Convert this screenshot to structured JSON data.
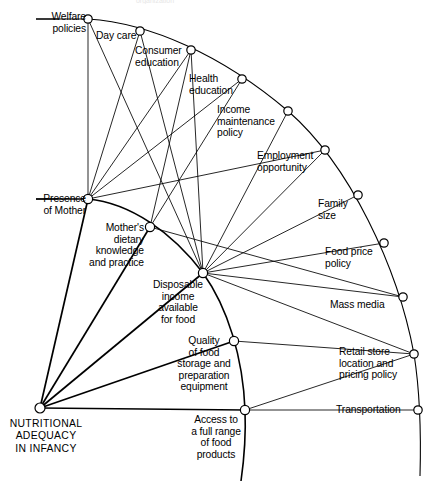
{
  "diagram": {
    "type": "radial-network-diagram",
    "title_partial_cut_off_at_top": "organization",
    "root": {
      "id": "nutritional-adequacy",
      "label": "NUTRITIONAL\nADEQUACY\nIN INFANCY",
      "x": 40,
      "y": 408
    },
    "ring1_label": "inner determinants",
    "nodes": [
      {
        "id": "welfare-policies",
        "label": "Welfare\npolicies",
        "x": 88,
        "y": 19,
        "lx": 28,
        "ly": 11,
        "align": "r",
        "w": 58
      },
      {
        "id": "day-care",
        "label": "Day care",
        "x": 140,
        "y": 31,
        "lx": 96,
        "ly": 30,
        "align": "l",
        "w": 52
      },
      {
        "id": "consumer-education",
        "label": "Consumer\neducation",
        "x": 191,
        "y": 50,
        "lx": 135,
        "ly": 45,
        "align": "l",
        "w": 58
      },
      {
        "id": "health-education",
        "label": "Health\neducation",
        "x": 242,
        "y": 79,
        "lx": 189,
        "ly": 73,
        "align": "l",
        "w": 54
      },
      {
        "id": "income-maintenance",
        "label": "Income\nmaintenance\npolicy",
        "x": 288,
        "y": 111,
        "lx": 218,
        "ly": 104,
        "align": "l",
        "w": 72
      },
      {
        "id": "employment-opportunity",
        "label": "Employment\nopportunity",
        "x": 325,
        "y": 150,
        "lx": 257,
        "ly": 150,
        "align": "l",
        "w": 70
      },
      {
        "id": "family-size",
        "label": "Family\nsize",
        "x": 358,
        "y": 195,
        "lx": 317,
        "ly": 198,
        "align": "l",
        "w": 44
      },
      {
        "id": "food-price-policy",
        "label": "Food price\npolicy",
        "x": 384,
        "y": 243,
        "lx": 325,
        "ly": 246,
        "align": "l",
        "w": 62
      },
      {
        "id": "mass-media",
        "label": "Mass media",
        "x": 403,
        "y": 297,
        "lx": 330,
        "ly": 299,
        "align": "l",
        "w": 70
      },
      {
        "id": "retail-store",
        "label": "Retail store\nlocation and\npricing policy",
        "x": 414,
        "y": 354,
        "lx": 339,
        "ly": 346,
        "align": "l",
        "w": 78
      },
      {
        "id": "transportation",
        "label": "Transportation",
        "x": 418,
        "y": 410,
        "lx": 336,
        "ly": 404,
        "align": "l",
        "w": 82
      },
      {
        "id": "presence-of-mother",
        "label": "Presence\nof Mother",
        "x": 88,
        "y": 199,
        "lx": 30,
        "ly": 193,
        "align": "r",
        "w": 58
      },
      {
        "id": "mothers-dietary-knowledge",
        "label": "Mother's\ndietary\nknowledge\nand practice",
        "x": 150,
        "y": 227,
        "lx": 26,
        "ly": 222,
        "align": "r",
        "w": 118
      },
      {
        "id": "disposable-income",
        "label": "Disposable\nincome\navailable\nfor food",
        "x": 203,
        "y": 273,
        "lx": 143,
        "ly": 279,
        "align": "c",
        "w": 72
      },
      {
        "id": "quality-of-food",
        "label": "Quality\nof food\nstorage and\npreparation\nequipment",
        "x": 234,
        "y": 341,
        "lx": 170,
        "ly": 335,
        "align": "c",
        "w": 70
      },
      {
        "id": "access-to-food",
        "label": "Access to\na full range\nof food\nproducts",
        "x": 245,
        "y": 410,
        "lx": 182,
        "ly": 414,
        "align": "c",
        "w": 68
      }
    ],
    "edges": [
      [
        "welfare-policies",
        "presence-of-mother"
      ],
      [
        "welfare-policies",
        "disposable-income"
      ],
      [
        "day-care",
        "presence-of-mother"
      ],
      [
        "day-care",
        "disposable-income"
      ],
      [
        "consumer-education",
        "presence-of-mother"
      ],
      [
        "consumer-education",
        "mothers-dietary-knowledge"
      ],
      [
        "consumer-education",
        "disposable-income"
      ],
      [
        "health-education",
        "presence-of-mother"
      ],
      [
        "health-education",
        "mothers-dietary-knowledge"
      ],
      [
        "income-maintenance",
        "disposable-income"
      ],
      [
        "employment-opportunity",
        "presence-of-mother"
      ],
      [
        "employment-opportunity",
        "disposable-income"
      ],
      [
        "family-size",
        "disposable-income"
      ],
      [
        "food-price-policy",
        "disposable-income"
      ],
      [
        "mass-media",
        "disposable-income"
      ],
      [
        "mass-media",
        "mothers-dietary-knowledge"
      ],
      [
        "retail-store",
        "disposable-income"
      ],
      [
        "retail-store",
        "access-to-food"
      ],
      [
        "retail-store",
        "quality-of-food"
      ],
      [
        "transportation",
        "access-to-food"
      ],
      [
        "presence-of-mother",
        "nutritional-adequacy"
      ],
      [
        "mothers-dietary-knowledge",
        "nutritional-adequacy"
      ],
      [
        "disposable-income",
        "nutritional-adequacy"
      ],
      [
        "quality-of-food",
        "nutritional-adequacy"
      ],
      [
        "access-to-food",
        "nutritional-adequacy"
      ]
    ]
  }
}
